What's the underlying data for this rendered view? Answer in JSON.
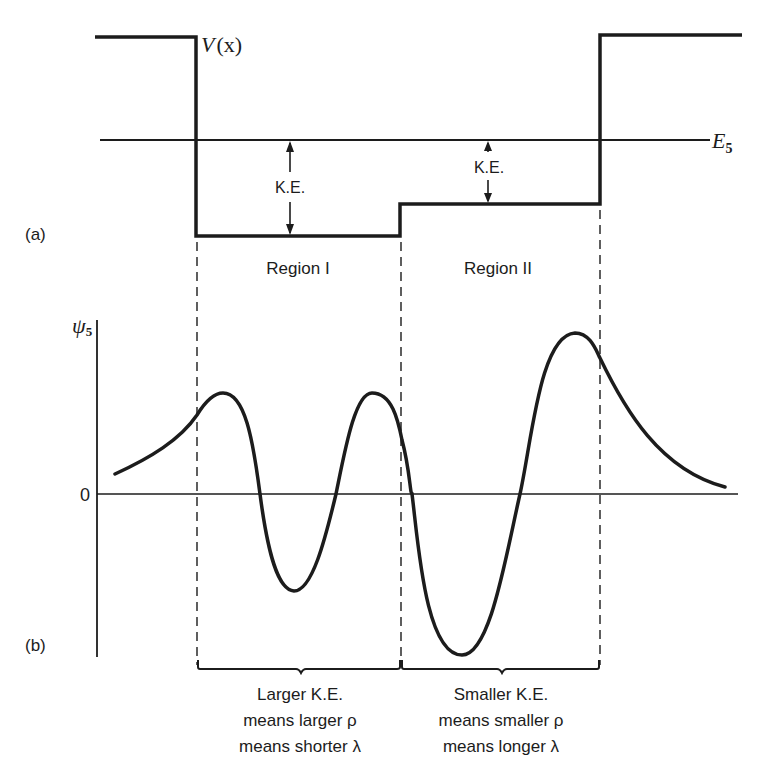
{
  "panel_a": {
    "label": "(a)",
    "potential_label": "V",
    "potential_arg": "(x)",
    "energy_label": "E",
    "energy_subscript": "5",
    "ke_label_1": "K.E.",
    "ke_label_2": "K.E.",
    "region_1": "Region I",
    "region_2": "Region II"
  },
  "panel_b": {
    "label": "(b)",
    "wavefunction_label": "ψ",
    "wavefunction_subscript": "5",
    "zero_label": "0"
  },
  "annotations": {
    "left": {
      "line1": "Larger K.E.",
      "line2": "means larger ρ",
      "line3": "means shorter λ"
    },
    "right": {
      "line1": "Smaller K.E.",
      "line2": "means smaller ρ",
      "line3": "means longer λ"
    }
  },
  "colors": {
    "ink": "#1c1c1c",
    "background": "#ffffff"
  }
}
